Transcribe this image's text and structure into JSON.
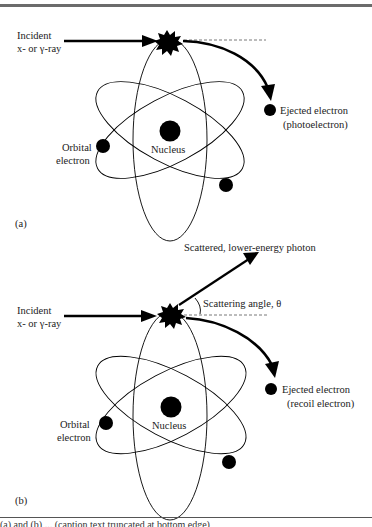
{
  "figure": {
    "panels": [
      {
        "id": "a",
        "label": "(a)",
        "incident_label_line1": "Incident",
        "incident_label_line2": "x- or γ-ray",
        "ejected_label_line1": "Ejected electron",
        "ejected_label_line2": "(photoelectron)",
        "nucleus_label": "Nucleus",
        "orbital_label_line1": "Orbital",
        "orbital_label_line2": "electron"
      },
      {
        "id": "b",
        "label": "(b)",
        "incident_label_line1": "Incident",
        "incident_label_line2": "x- or γ-ray",
        "scattered_label": "Scattered, lower-energy photon",
        "angle_label": "Scattering angle, θ",
        "ejected_label_line1": "Ejected electron",
        "ejected_label_line2": "(recoil electron)",
        "nucleus_label": "Nucleus",
        "orbital_label_line1": "Orbital",
        "orbital_label_line2": "electron"
      }
    ],
    "caption_fragment": "(a) and (b) ... (caption text truncated at bottom edge)",
    "colors": {
      "ink": "#000000",
      "rule": "#6b6b6b",
      "text": "#222222"
    }
  }
}
